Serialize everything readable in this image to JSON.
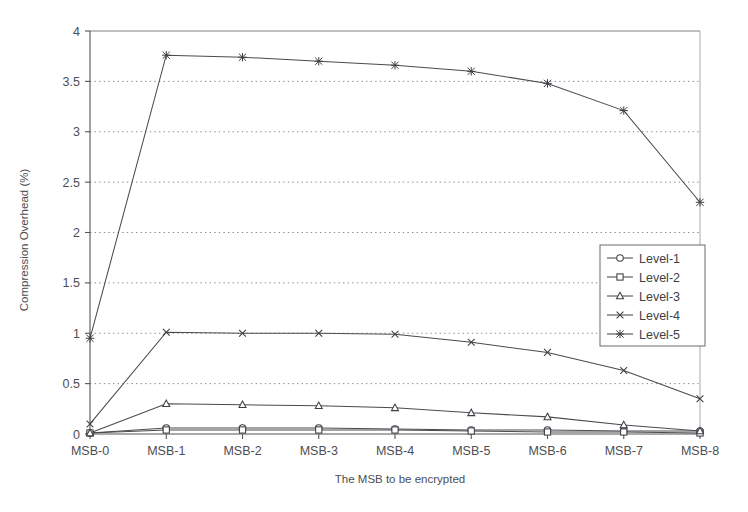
{
  "chart_data": {
    "type": "line",
    "title": "",
    "xlabel": "The MSB to be encrypted",
    "ylabel": "Compression Overhead (%)",
    "categories": [
      "MSB-0",
      "MSB-1",
      "MSB-2",
      "MSB-3",
      "MSB-4",
      "MSB-5",
      "MSB-6",
      "MSB-7",
      "MSB-8"
    ],
    "ylim": [
      0,
      4
    ],
    "xlim_categories": 9,
    "ytick_labels": [
      "0",
      "0.5",
      "1",
      "1.5",
      "2",
      "2.5",
      "3",
      "3.5",
      "4"
    ],
    "ytick_values": [
      0,
      0.5,
      1,
      1.5,
      2,
      2.5,
      3,
      3.5,
      4
    ],
    "grid": "horizontal-dotted",
    "legend_position": "right-middle",
    "series": [
      {
        "name": "Level-1",
        "marker": "circle",
        "values": [
          0.01,
          0.06,
          0.06,
          0.06,
          0.05,
          0.04,
          0.04,
          0.03,
          0.03
        ]
      },
      {
        "name": "Level-2",
        "marker": "square",
        "values": [
          0.01,
          0.04,
          0.04,
          0.04,
          0.04,
          0.03,
          0.02,
          0.02,
          0.01
        ]
      },
      {
        "name": "Level-3",
        "marker": "triangle",
        "values": [
          0.01,
          0.3,
          0.29,
          0.28,
          0.26,
          0.21,
          0.17,
          0.09,
          0.03
        ]
      },
      {
        "name": "Level-4",
        "marker": "cross",
        "values": [
          0.1,
          1.01,
          1.0,
          1.0,
          0.99,
          0.91,
          0.81,
          0.63,
          0.35
        ]
      },
      {
        "name": "Level-5",
        "marker": "star",
        "values": [
          0.95,
          3.76,
          3.74,
          3.7,
          3.66,
          3.6,
          3.48,
          3.21,
          2.3
        ]
      }
    ]
  }
}
